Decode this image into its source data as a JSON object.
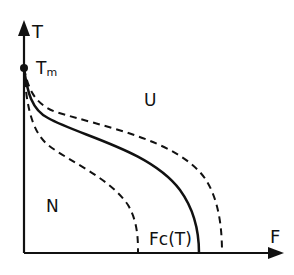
{
  "diagram": {
    "axes": {
      "y_label": "T",
      "x_label": "F"
    },
    "point_label": "Tm",
    "point_label_main": "T",
    "point_label_sub": "m",
    "regions": {
      "upper": "U",
      "lower": "N"
    },
    "curve_label": "Fc(T)",
    "curves": [
      {
        "name": "critical-curve",
        "style": "solid"
      },
      {
        "name": "inner-bound",
        "style": "dashed"
      },
      {
        "name": "outer-bound",
        "style": "dashed"
      }
    ],
    "colors": {
      "ink": "#111111",
      "background": "#ffffff"
    }
  }
}
